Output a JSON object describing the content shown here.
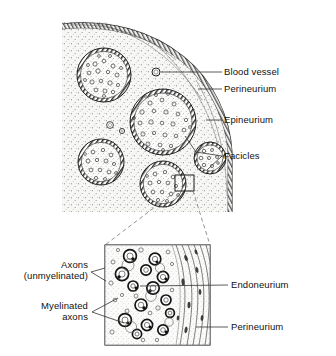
{
  "figure": {
    "panels": [
      {
        "name": "overview",
        "caption": "Transverse section of a peripheral nerve (quadrant view)"
      },
      {
        "name": "detail",
        "caption": "Enlarged detail of fascicle edge"
      }
    ]
  },
  "labels": {
    "blood_vessel": "Blood vessel",
    "perineurium_top": "Perineurium",
    "epineurium": "Epineurium",
    "facicles": "Facicles",
    "axons_line1": "Axons",
    "axons_line2": "(unmyelinated)",
    "myelinated_line1": "Myelinated",
    "myelinated_line2": "axons",
    "endoneurium": "Endoneurium",
    "perineurium_bottom": "Perineurium"
  },
  "colors": {
    "ink": "#1a1a1a",
    "stipple": "#4a4a4a",
    "fill_epineurium": "#f7f7f5",
    "fill_fascicle": "#fbfbfa",
    "leader": "#333333",
    "dashed_callout": "#777777"
  },
  "structures": {
    "fascicles": [
      {
        "id": "fascicle-1",
        "cx": 104,
        "cy": 75,
        "r": 27
      },
      {
        "id": "fascicle-2",
        "cx": 163,
        "cy": 122,
        "r": 33
      },
      {
        "id": "fascicle-3",
        "cx": 101,
        "cy": 162,
        "r": 23
      },
      {
        "id": "fascicle-4",
        "cx": 163,
        "cy": 184,
        "r": 23
      },
      {
        "id": "fascicle-5",
        "cx": 210,
        "cy": 158,
        "r": 16
      }
    ],
    "blood_vessels": [
      {
        "id": "blood-vessel-main",
        "cx": 156,
        "cy": 72,
        "r": 4.0
      },
      {
        "id": "blood-vessel-a",
        "cx": 110,
        "cy": 125,
        "r": 3.4
      },
      {
        "id": "blood-vessel-b",
        "cx": 122,
        "cy": 131,
        "r": 2.6
      }
    ],
    "callout_box": {
      "x": 175,
      "y": 175,
      "w": 19,
      "h": 16
    },
    "detail_panel": {
      "x": 105,
      "y": 245,
      "w": 105,
      "h": 100
    }
  }
}
